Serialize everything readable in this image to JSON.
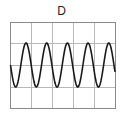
{
  "panel": {
    "label": "D",
    "grid": {
      "columns": 5,
      "rows": 4
    },
    "colors": {
      "grid": "#b0b0b0",
      "frame": "#8a8a8a",
      "wave": "#1a1a1a"
    }
  },
  "chart_data": {
    "type": "line",
    "title": "D",
    "series": [
      {
        "name": "sine",
        "cycles": 5,
        "amplitude_divisions": 1.3,
        "phase": "starts at center going down"
      }
    ],
    "grid": true,
    "xlabel": "",
    "ylabel": ""
  }
}
